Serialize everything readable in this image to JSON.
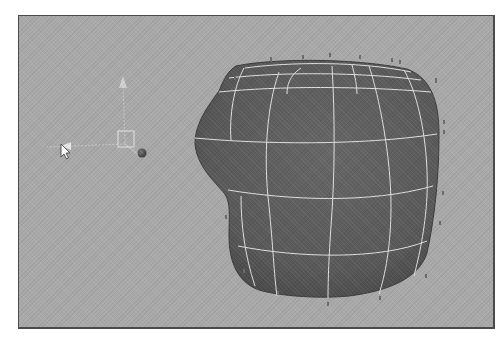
{
  "viewport": {
    "name": "3D perspective viewport",
    "background_color": "#a9a9a9",
    "border_color": "#4a4a4a"
  },
  "object": {
    "type": "NURBS surface",
    "surface_color": "#5c5c5c",
    "isoparm_color": "#e6e6e6",
    "cv_marker_color": "#6a6a6a"
  },
  "manipulator": {
    "type": "move-tool gizmo",
    "axis_color": "#c8c8c8",
    "pivot_handle_color": "#dcdcdc",
    "ball_color": "#505050"
  },
  "cursor": {
    "type": "arrow-pointer",
    "color": "#ffffff"
  }
}
